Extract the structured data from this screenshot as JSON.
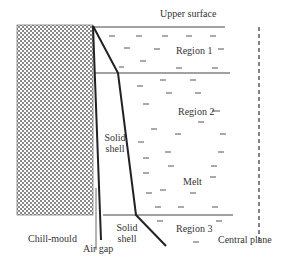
{
  "labels": {
    "upper_surface": "Upper surface",
    "region1": "Region 1",
    "region2": "Region 2",
    "region3": "Region 3",
    "melt": "Melt",
    "solid_shell_upper_line1": "Solid",
    "solid_shell_upper_line2": "shell",
    "solid_shell_lower_line1": "Solid",
    "solid_shell_lower_line2": "shell",
    "chill_mould": "Chill-mould",
    "air_gap": "Air gap",
    "central_plane": "Central plane"
  },
  "colors": {
    "line": "#333333",
    "hatch": "#7a7a7a",
    "background": "#ffffff"
  }
}
